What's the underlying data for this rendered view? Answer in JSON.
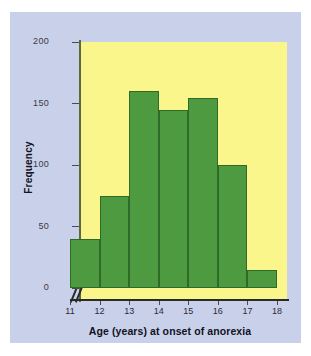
{
  "chart_data": {
    "type": "bar",
    "title": "",
    "subtitle": "",
    "xlabel": "Age (years) at onset of anorexia",
    "ylabel": "Frequency",
    "categories": [
      "11-12",
      "12-13",
      "13-14",
      "14-15",
      "15-16",
      "16-17",
      "17-18"
    ],
    "bin_edges": [
      11,
      12,
      13,
      14,
      15,
      16,
      17,
      18
    ],
    "values": [
      40,
      75,
      160,
      145,
      155,
      100,
      15
    ],
    "xlim": [
      11,
      18
    ],
    "ylim": [
      0,
      210
    ],
    "x_ticks": [
      "11",
      "12",
      "13",
      "14",
      "15",
      "16",
      "17",
      "18"
    ],
    "y_ticks": [
      "0",
      "50",
      "100",
      "150",
      "200"
    ],
    "y_tick_values": [
      0,
      50,
      100,
      150,
      200
    ],
    "grid": false,
    "legend": "none",
    "axis_break": "//",
    "colors": {
      "bar_fill": "#4e9a41",
      "bar_edge": "#2f6b28",
      "plot_background": "#faf68c",
      "panel_background": "#c9d1ea",
      "figure_background": "#ffffff",
      "axis": "#2a2a2a",
      "text": "#111122"
    }
  }
}
